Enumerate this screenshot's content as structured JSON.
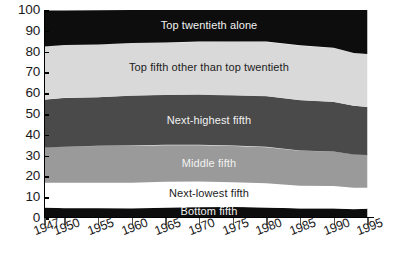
{
  "chart_data": {
    "type": "area",
    "title": "",
    "subtitle": "",
    "xlabel": "",
    "ylabel": "",
    "stacked": true,
    "normalized_percent": true,
    "grid": false,
    "legend_position": "inline-band-labels",
    "xlim": [
      1947,
      1996
    ],
    "ylim": [
      0,
      100
    ],
    "ytick_values": [
      0,
      10,
      20,
      30,
      40,
      50,
      60,
      70,
      80,
      90,
      100
    ],
    "ytick_labels": [
      "0",
      "10",
      "20",
      "30",
      "40",
      "50",
      "60",
      "70",
      "80",
      "90",
      "100"
    ],
    "xtick_values": [
      1947,
      1950,
      1955,
      1960,
      1965,
      1970,
      1975,
      1980,
      1985,
      1990,
      1995
    ],
    "xtick_labels": [
      "1947",
      "1950",
      "1955",
      "1960",
      "1965",
      "1970",
      "1975",
      "1980",
      "1985",
      "1990",
      "1995"
    ],
    "x": [
      1947,
      1950,
      1955,
      1960,
      1965,
      1970,
      1975,
      1980,
      1985,
      1990,
      1993,
      1995
    ],
    "series": [
      {
        "name": "Bottom fifth",
        "color": "#0d0d0d",
        "label_color": "light",
        "values": [
          5.0,
          4.8,
          4.8,
          4.8,
          5.2,
          5.4,
          5.4,
          5.1,
          4.6,
          4.6,
          4.2,
          4.4
        ]
      },
      {
        "name": "Next-lowest fifth",
        "color": "#ffffff",
        "label_color": "dark",
        "values": [
          11.9,
          12.1,
          12.2,
          12.2,
          12.2,
          12.2,
          11.8,
          11.6,
          10.9,
          10.8,
          10.3,
          10.1
        ]
      },
      {
        "name": "Middle fifth",
        "color": "#9a9a9a",
        "label_color": "light",
        "values": [
          17.0,
          17.4,
          17.7,
          17.8,
          17.8,
          17.6,
          17.6,
          17.5,
          16.9,
          16.6,
          16.0,
          15.8
        ]
      },
      {
        "name": "Next-highest fifth",
        "color": "#4a4a4a",
        "label_color": "light",
        "values": [
          23.1,
          23.5,
          23.4,
          24.0,
          23.9,
          24.1,
          24.1,
          24.3,
          24.2,
          23.8,
          23.5,
          23.2
        ]
      },
      {
        "name": "Top fifth other than top twentieth",
        "color": "#d9d9d9",
        "label_color": "dark",
        "values": [
          25.5,
          25.4,
          25.3,
          25.3,
          25.3,
          25.5,
          26.0,
          26.3,
          26.4,
          26.0,
          25.3,
          25.3
        ]
      },
      {
        "name": "Top twentieth alone",
        "color": "#0d0d0d",
        "label_color": "light",
        "values": [
          17.5,
          16.8,
          16.6,
          15.9,
          15.6,
          15.2,
          15.1,
          15.2,
          17.0,
          18.2,
          20.7,
          21.2
        ]
      }
    ],
    "cumulative_top_boundaries": {
      "note": "upper edge of each stacked band as percent of total, bottom-to-top",
      "bottom_fifth": [
        5.0,
        4.8,
        4.8,
        4.8,
        5.2,
        5.4,
        5.4,
        5.1,
        4.6,
        4.6,
        4.2,
        4.4
      ],
      "next_lowest_fifth": [
        16.9,
        16.9,
        17.0,
        17.0,
        17.4,
        17.6,
        17.2,
        16.7,
        15.5,
        15.4,
        14.5,
        14.5
      ],
      "middle_fifth": [
        33.9,
        34.3,
        34.7,
        34.8,
        35.2,
        35.2,
        34.8,
        34.2,
        32.4,
        32.0,
        30.5,
        30.3
      ],
      "next_highest_fifth": [
        57.0,
        57.8,
        58.1,
        58.8,
        59.1,
        59.3,
        58.9,
        58.5,
        56.6,
        55.8,
        54.0,
        53.5
      ],
      "top_fifth_other": [
        82.5,
        83.2,
        83.4,
        84.1,
        84.4,
        84.8,
        84.9,
        84.8,
        83.0,
        81.8,
        79.3,
        78.8
      ],
      "top_twentieth": [
        100,
        100,
        100,
        100,
        100,
        100,
        100,
        100,
        100,
        100,
        100,
        100
      ]
    }
  },
  "band_labels": [
    {
      "text": "Top twentieth alone"
    },
    {
      "text": "Top fifth other than top twentieth"
    },
    {
      "text": "Next-highest fifth"
    },
    {
      "text": "Middle fifth"
    },
    {
      "text": "Next-lowest fifth"
    },
    {
      "text": "Bottom fifth"
    }
  ],
  "colors": {
    "axis": "#000000",
    "tick": "#555555",
    "text": "#1a1a1a",
    "background": "#ffffff",
    "band_black": "#0d0d0d",
    "band_white": "#ffffff",
    "band_mid_gray": "#9a9a9a",
    "band_dark_gray": "#4a4a4a",
    "band_light_gray": "#d9d9d9"
  }
}
